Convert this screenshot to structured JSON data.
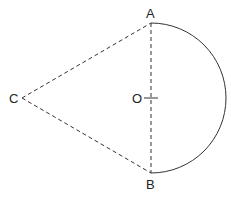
{
  "diagram": {
    "points": {
      "A": {
        "label": "A",
        "x": 151,
        "y": 23
      },
      "B": {
        "label": "B",
        "x": 151,
        "y": 173
      },
      "C": {
        "label": "C",
        "x": 22,
        "y": 98
      },
      "O": {
        "label": "O",
        "x": 151,
        "y": 98
      }
    },
    "segments": [
      {
        "from": "C",
        "to": "A",
        "style": "dashed"
      },
      {
        "from": "C",
        "to": "B",
        "style": "dashed"
      },
      {
        "from": "A",
        "to": "B",
        "style": "dashed"
      }
    ],
    "arcs": [
      {
        "center": "O",
        "from": "A",
        "to": "B",
        "side": "right",
        "style": "solid",
        "radius": 75
      }
    ],
    "stroke_color": "#333333"
  }
}
